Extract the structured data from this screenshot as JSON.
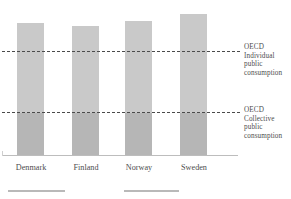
{
  "chart_data": {
    "type": "bar",
    "title": "",
    "subtitle": "",
    "xlabel": "",
    "ylabel": "",
    "categories": [
      "Denmark",
      "Finland",
      "Norway",
      "Sweden"
    ],
    "values": [
      89,
      87,
      90,
      95
    ],
    "ylim": [
      0,
      107
    ],
    "grid": false,
    "legend_position": "right",
    "series": [
      {
        "name": "Public consumption",
        "values": [
          89,
          87,
          90,
          95
        ]
      }
    ],
    "reference_lines": [
      {
        "id": "individual",
        "label": "OECD Individual public consumption",
        "label_lines": [
          "OECD",
          "Individual",
          "public",
          "consumption"
        ],
        "value": 71,
        "style": "dashed",
        "color": "#4a4a4a"
      },
      {
        "id": "collective",
        "label": "OECD Collective public consumption",
        "label_lines": [
          "OECD",
          "Collective",
          "public",
          "consumption"
        ],
        "value": 29,
        "style": "dashed",
        "color": "#4a4a4a"
      }
    ],
    "segments": {
      "upper_label": "Individual public consumption",
      "lower_label": "Collective public consumption",
      "upper_color": "#c9c9c9",
      "lower_color": "#b6b6b6"
    },
    "axis_color": "#bdbdbd",
    "background": "#ffffff"
  },
  "bars": [
    {
      "name": "Denmark",
      "value": 89,
      "top_px": 22,
      "lower_height_px": 43
    },
    {
      "name": "Finland",
      "value": 87,
      "top_px": 25,
      "lower_height_px": 43
    },
    {
      "name": "Norway",
      "value": 90,
      "top_px": 20,
      "lower_height_px": 43
    },
    {
      "name": "Sweden",
      "value": 95,
      "top_px": 13,
      "lower_height_px": 43
    }
  ],
  "labels": {
    "denmark": "Denmark",
    "finland": "Finland",
    "norway": "Norway",
    "sweden": "Sweden"
  },
  "annotations": {
    "individual": {
      "line1": "OECD",
      "line2": "Individual",
      "line3": "public",
      "line4": "consumption"
    },
    "collective": {
      "line1": "OECD",
      "line2": "Collective",
      "line3": "public",
      "line4": "consumption"
    }
  }
}
